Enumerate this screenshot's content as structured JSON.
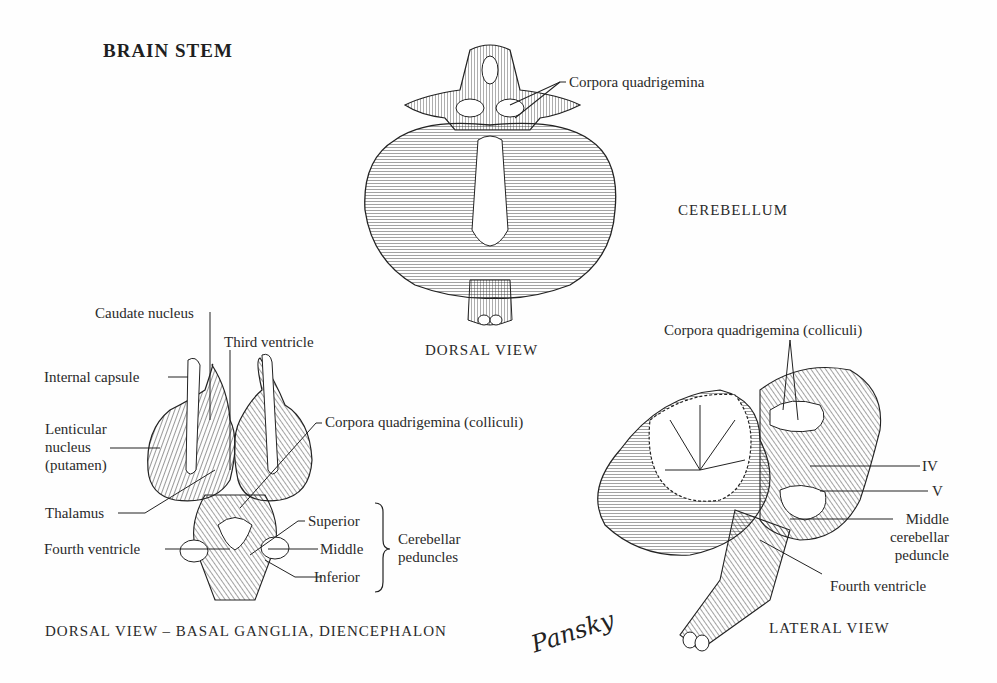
{
  "figure": {
    "title": "BRAIN STEM",
    "signature": "Pansky",
    "panels": {
      "dorsal_cerebellum": {
        "section_label": "CEREBELLUM",
        "caption": "DORSAL VIEW",
        "labels": [
          "Corpora quadrigemina"
        ]
      },
      "dorsal_basal_ganglia": {
        "caption": "DORSAL VIEW – BASAL GANGLIA, DIENCEPHALON",
        "labels": {
          "caudate": "Caudate nucleus",
          "third_ventricle": "Third ventricle",
          "internal_capsule": "Internal capsule",
          "lenticular_1": "Lenticular",
          "lenticular_2": "nucleus",
          "lenticular_3": "(putamen)",
          "corpora": "Corpora quadrigemina (colliculi)",
          "thalamus": "Thalamus",
          "superior": "Superior",
          "middle": "Middle",
          "inferior": "Inferior",
          "fourth_ventricle": "Fourth ventricle",
          "peduncles_1": "Cerebellar",
          "peduncles_2": "peduncles"
        }
      },
      "lateral": {
        "caption": "LATERAL VIEW",
        "labels": {
          "corpora": "Corpora quadrigemina (colliculi)",
          "iv": "IV",
          "v": "V",
          "mcp_1": "Middle",
          "mcp_2": "cerebellar",
          "mcp_3": "peduncle",
          "fourth_ventricle": "Fourth ventricle"
        }
      }
    }
  }
}
